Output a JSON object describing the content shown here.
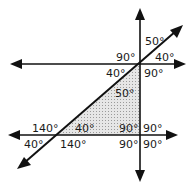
{
  "diagram": {
    "colors": {
      "line": "#111111",
      "shade": "#cfcfcf",
      "background": "#ffffff"
    },
    "labels": {
      "top_right_upper": "50°",
      "top_right_lower": "40°",
      "top_left_upper": "90°",
      "top_left_lower": "40°",
      "top_below_right": "90°",
      "triangle_top": "50°",
      "bottom_left_upper": "140°",
      "bottom_triangle_left": "40°",
      "bottom_left_lower": "40°",
      "bottom_mid_lower": "140°",
      "bottom_right_ul": "90°",
      "bottom_right_ur": "90°",
      "bottom_right_ll": "90°",
      "bottom_right_lr": "90°"
    }
  }
}
